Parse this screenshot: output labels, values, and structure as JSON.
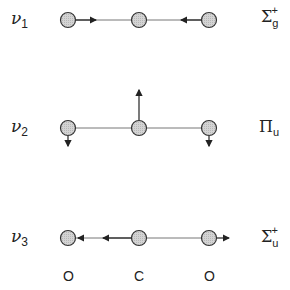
{
  "modes": [
    {
      "label": "ν",
      "index": "1",
      "symmetry": "Σ",
      "sym_sub": "g",
      "sym_sup": "+"
    },
    {
      "label": "ν",
      "index": "2",
      "symmetry": "Π",
      "sym_sub": "u",
      "sym_sup": ""
    },
    {
      "label": "ν",
      "index": "3",
      "symmetry": "Σ",
      "sym_sub": "u",
      "sym_sup": "+"
    }
  ],
  "atoms": [
    "O",
    "C",
    "O"
  ],
  "colors": {
    "atom_fill": "#cccccc",
    "stroke": "#333333"
  }
}
